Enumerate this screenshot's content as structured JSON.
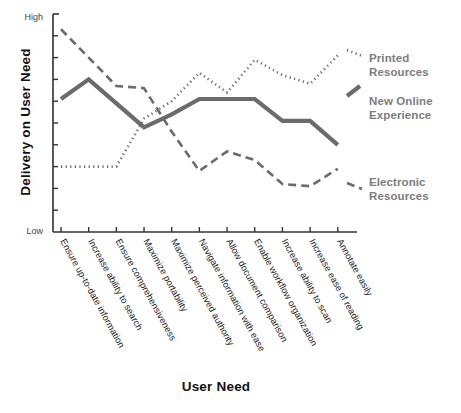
{
  "chart_data": {
    "type": "line",
    "title": "",
    "xlabel": "User Need",
    "ylabel": "Delivery on User Need",
    "ylim": [
      0,
      10
    ],
    "y_axis_top_label": "High",
    "y_axis_bottom_label": "Low",
    "y_tick_count": 9,
    "grid": false,
    "legend_position": "right",
    "categories": [
      "Ensure up-to-date information",
      "Increase ability to search",
      "Ensure comprehensiveness",
      "Maximize portability",
      "Maximize perceived authority",
      "Navigate information with ease",
      "Allow document comparison",
      "Enable workflow organization",
      "Increase ability to scan",
      "Increase ease of reading",
      "Annotate easily"
    ],
    "series": [
      {
        "name": "Printed Resources",
        "style": "dotted",
        "color": "#6b6b6b",
        "values": [
          3.0,
          3.0,
          3.0,
          5.2,
          6.0,
          7.3,
          6.4,
          7.9,
          7.2,
          6.8,
          8.1
        ]
      },
      {
        "name": "New Online Experience",
        "style": "solid",
        "color": "#6b6b6b",
        "values": [
          6.1,
          7.0,
          5.9,
          4.8,
          5.4,
          6.1,
          6.1,
          6.1,
          5.1,
          5.1,
          4.0
        ]
      },
      {
        "name": "Electronic Resources",
        "style": "dashed",
        "color": "#6b6b6b",
        "values": [
          9.3,
          8.0,
          6.7,
          6.6,
          4.6,
          2.8,
          3.7,
          3.3,
          2.2,
          2.1,
          2.9
        ]
      }
    ]
  },
  "legend": {
    "entries": [
      {
        "label_line1": "Printed",
        "label_line2": "Resources"
      },
      {
        "label_line1": "New Online",
        "label_line2": "Experience"
      },
      {
        "label_line1": "Electronic",
        "label_line2": "Resources"
      }
    ]
  },
  "colors": {
    "line": "#6b6b6b",
    "axis": "#333333",
    "legend_text": "#7d7d7d",
    "title_text": "#111111",
    "category_text": "#1c1c1c",
    "background": "#ffffff"
  }
}
